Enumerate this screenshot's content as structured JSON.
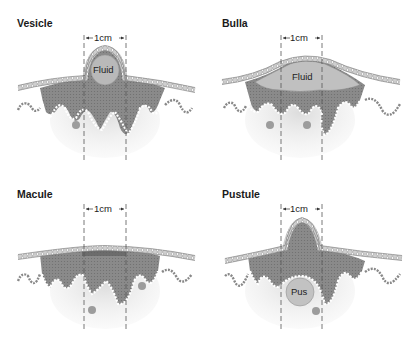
{
  "figure": {
    "panels": [
      {
        "id": "vesicle",
        "title": "Vesicle",
        "scale_label": "1cm",
        "inner_label": "Fluid"
      },
      {
        "id": "bulla",
        "title": "Bulla",
        "scale_label": "1cm",
        "inner_label": "Fluid"
      },
      {
        "id": "macule",
        "title": "Macule",
        "scale_label": "1cm",
        "inner_label": ""
      },
      {
        "id": "pustule",
        "title": "Pustule",
        "scale_label": "1cm",
        "inner_label": "Pus"
      }
    ],
    "colors": {
      "epidermis": "#8c8c8c",
      "dermis": "#d9d9d9",
      "stratum_corneum": "#c8c8c8",
      "fluid": "#bdbdbd",
      "pigment": "#5a5a5a",
      "dashed_line": "#555555"
    }
  }
}
